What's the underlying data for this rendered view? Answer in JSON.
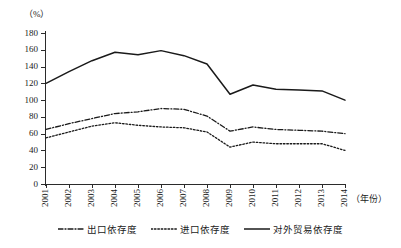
{
  "chart_data": {
    "type": "line",
    "title": "",
    "subtitle": "",
    "xlabel": "（年份）",
    "ylabel": "（%）",
    "x": [
      "2001",
      "2002",
      "2003",
      "2004",
      "2005",
      "2006",
      "2007",
      "2008",
      "2009",
      "2010",
      "2011",
      "2012",
      "2013",
      "2014"
    ],
    "categories": [
      "2001",
      "2002",
      "2003",
      "2004",
      "2005",
      "2006",
      "2007",
      "2008",
      "2009",
      "2010",
      "2011",
      "2012",
      "2013",
      "2014"
    ],
    "ylim": [
      0,
      180
    ],
    "yticks": [
      0,
      20,
      40,
      60,
      80,
      100,
      120,
      140,
      160,
      180
    ],
    "grid": false,
    "legend_position": "bottom",
    "series": [
      {
        "name": "出口依存度",
        "style": "dash-dot",
        "color": "#1a1a1a",
        "values": [
          65,
          72,
          78,
          84,
          86,
          90,
          89,
          81,
          63,
          68,
          65,
          64,
          63,
          60
        ]
      },
      {
        "name": "进口依存度",
        "style": "dotted",
        "color": "#1a1a1a",
        "values": [
          55,
          62,
          69,
          73,
          70,
          68,
          67,
          62,
          44,
          50,
          48,
          48,
          48,
          40
        ]
      },
      {
        "name": "对外贸易依存度",
        "style": "solid",
        "color": "#1a1a1a",
        "values": [
          120,
          134,
          147,
          157,
          154,
          159,
          153,
          143,
          107,
          118,
          113,
          112,
          111,
          100
        ]
      }
    ]
  },
  "axis": {
    "y_unit": "（%）",
    "x_unit": "（年份）",
    "y_tick_labels": [
      "180",
      "160",
      "140",
      "120",
      "100",
      "80",
      "60",
      "40",
      "20",
      "0"
    ],
    "x_tick_labels": [
      "2001",
      "2002",
      "2003",
      "2004",
      "2005",
      "2006",
      "2007",
      "2008",
      "2009",
      "2010",
      "2011",
      "2012",
      "2013",
      "2014"
    ]
  },
  "legend": {
    "items": [
      {
        "label": "出口依存度",
        "style": "dash-dot"
      },
      {
        "label": "进口依存度",
        "style": "dotted"
      },
      {
        "label": "对外贸易依存度",
        "style": "solid"
      }
    ]
  },
  "colors": {
    "ink": "#1a1a1a",
    "axis": "#2b2b2b",
    "background": "#ffffff"
  }
}
